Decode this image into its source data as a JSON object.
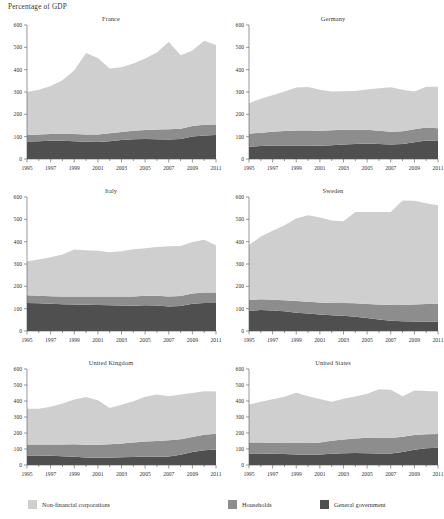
{
  "figure": {
    "header": "Percentage of GDP",
    "y_ticks": [
      0,
      100,
      200,
      300,
      400,
      500,
      600
    ],
    "x_ticks": [
      1995,
      1997,
      1999,
      2001,
      2003,
      2005,
      2007,
      2009,
      2011
    ],
    "years": [
      1995,
      1996,
      1997,
      1998,
      1999,
      2000,
      2001,
      2002,
      2003,
      2004,
      2005,
      2006,
      2007,
      2008,
      2009,
      2010,
      2011
    ]
  },
  "colors": {
    "non_financial_corporations": "#cfcfcf",
    "households": "#8d8d8d",
    "general_government": "#4f4f4f",
    "axis": "#555555",
    "text": "#333333",
    "background": "#ffffff"
  },
  "legend": {
    "items": [
      {
        "label": "Non-financial corporations",
        "color_key": "non_financial_corporations"
      },
      {
        "label": "Households",
        "color_key": "households"
      },
      {
        "label": "General government",
        "color_key": "general_government"
      }
    ]
  },
  "chart_data": {
    "type": "area",
    "stacked": true,
    "title": "",
    "xlabel": "",
    "ylabel": "Percentage of GDP",
    "ylim": [
      0,
      600
    ],
    "xlim": [
      1995,
      2011
    ],
    "grid": false,
    "legend_position": "bottom",
    "series_order": [
      "general_government",
      "households",
      "non_financial_corporations"
    ],
    "series_labels": {
      "general_government": "General government",
      "households": "Households",
      "non_financial_corporations": "Non-financial corporations"
    },
    "x": [
      1995,
      1996,
      1997,
      1998,
      1999,
      2000,
      2001,
      2002,
      2003,
      2004,
      2005,
      2006,
      2007,
      2008,
      2009,
      2010,
      2011
    ],
    "panels": [
      {
        "title": "France",
        "series": [
          {
            "name": "General government",
            "key": "general_government",
            "values": [
              78,
              80,
              82,
              82,
              80,
              77,
              76,
              80,
              85,
              88,
              89,
              88,
              87,
              90,
              101,
              105,
              107
            ]
          },
          {
            "name": "Households",
            "key": "households",
            "values": [
              30,
              30,
              30,
              31,
              32,
              33,
              34,
              35,
              36,
              38,
              41,
              44,
              46,
              46,
              47,
              48,
              48
            ]
          },
          {
            "name": "Non-financial corporations",
            "key": "non_financial_corporations",
            "values": [
              192,
              200,
              215,
              240,
              285,
              365,
              342,
              290,
              290,
              302,
              320,
              345,
              392,
              329,
              338,
              377,
              355
            ]
          }
        ],
        "totals": [
          300,
          310,
          327,
          353,
          397,
          475,
          452,
          405,
          411,
          428,
          450,
          477,
          525,
          465,
          486,
          530,
          510
        ]
      },
      {
        "title": "Germany",
        "series": [
          {
            "name": "General government",
            "key": "general_government",
            "values": [
              55,
              58,
              60,
              60,
              61,
              60,
              59,
              62,
              65,
              67,
              69,
              67,
              65,
              67,
              75,
              83,
              81
            ]
          },
          {
            "name": "Households",
            "key": "households",
            "values": [
              58,
              60,
              62,
              65,
              67,
              68,
              68,
              67,
              66,
              64,
              62,
              60,
              57,
              57,
              58,
              58,
              57
            ]
          },
          {
            "name": "Non-financial corporations",
            "key": "non_financial_corporations",
            "values": [
              137,
              152,
              163,
              177,
              192,
              194,
              183,
              173,
              172,
              174,
              180,
              190,
              199,
              186,
              169,
              183,
              186
            ]
          }
        ],
        "totals": [
          250,
          270,
          285,
          302,
          320,
          322,
          310,
          302,
          303,
          305,
          311,
          317,
          321,
          310,
          302,
          324,
          324
        ]
      },
      {
        "title": "Italy",
        "series": [
          {
            "name": "General government",
            "key": "general_government",
            "values": [
              125,
              124,
              122,
              120,
              119,
              117,
              116,
              115,
              114,
              113,
              115,
              114,
              110,
              112,
              122,
              125,
              125
            ]
          },
          {
            "name": "Households",
            "key": "households",
            "values": [
              35,
              34,
              34,
              35,
              36,
              37,
              38,
              39,
              40,
              42,
              43,
              44,
              45,
              45,
              46,
              47,
              47
            ]
          },
          {
            "name": "Non-financial corporations",
            "key": "non_financial_corporations",
            "values": [
              152,
              162,
              174,
              187,
              210,
              208,
              205,
              199,
              203,
              211,
              213,
              218,
              224,
              224,
              231,
              237,
              212
            ]
          }
        ],
        "totals": [
          312,
          320,
          330,
          342,
          365,
          362,
          359,
          353,
          357,
          366,
          371,
          376,
          379,
          381,
          399,
          409,
          384
        ]
      },
      {
        "title": "Sweden",
        "series": [
          {
            "name": "General government",
            "key": "general_government",
            "values": [
              90,
              94,
              92,
              88,
              82,
              78,
              74,
              70,
              68,
              64,
              58,
              52,
              46,
              44,
              43,
              42,
              41
            ]
          },
          {
            "name": "Households",
            "key": "households",
            "values": [
              49,
              48,
              48,
              50,
              52,
              53,
              54,
              55,
              57,
              60,
              63,
              67,
              70,
              72,
              76,
              79,
              81
            ]
          },
          {
            "name": "Non-financial corporations",
            "key": "non_financial_corporations",
            "values": [
              246,
              281,
              309,
              336,
              370,
              387,
              380,
              370,
              366,
              409,
              412,
              414,
              417,
              468,
              464,
              451,
              441
            ]
          }
        ],
        "totals": [
          385,
          423,
          449,
          474,
          504,
          518,
          508,
          495,
          491,
          533,
          533,
          533,
          533,
          584,
          583,
          572,
          563
        ]
      },
      {
        "title": "United Kingdom",
        "series": [
          {
            "name": "General government",
            "key": "general_government",
            "values": [
              60,
              60,
              58,
              55,
              52,
              47,
              45,
              46,
              48,
              50,
              53,
              52,
              53,
              64,
              81,
              92,
              97
            ]
          },
          {
            "name": "Households",
            "key": "households",
            "values": [
              68,
              68,
              70,
              73,
              77,
              80,
              82,
              84,
              87,
              91,
              94,
              98,
              101,
              97,
              94,
              97,
              99
            ]
          },
          {
            "name": "Non-financial corporations",
            "key": "non_financial_corporations",
            "values": [
              224,
              223,
              236,
              257,
              281,
              298,
              278,
              227,
              242,
              258,
              279,
              290,
              275,
              279,
              275,
              272,
              264
            ]
          }
        ],
        "totals": [
          352,
          351,
          364,
          385,
          410,
          425,
          405,
          357,
          377,
          399,
          426,
          440,
          429,
          440,
          450,
          461,
          460
        ]
      },
      {
        "title": "United States",
        "series": [
          {
            "name": "General government",
            "key": "general_government",
            "values": [
              72,
              72,
              70,
              68,
              66,
              64,
              65,
              70,
              74,
              75,
              74,
              72,
              72,
              82,
              96,
              105,
              108
            ]
          },
          {
            "name": "Households",
            "key": "households",
            "values": [
              68,
              68,
              69,
              70,
              72,
              73,
              76,
              81,
              86,
              91,
              96,
              97,
              96,
              95,
              92,
              87,
              85
            ]
          },
          {
            "name": "Non-financial corporations",
            "key": "non_financial_corporations",
            "values": [
              238,
              255,
              272,
              288,
              314,
              292,
              272,
              245,
              254,
              262,
              275,
              304,
              302,
              252,
              277,
              270,
              267
            ]
          }
        ],
        "totals": [
          378,
          395,
          411,
          426,
          452,
          429,
          413,
          396,
          414,
          428,
          445,
          473,
          470,
          429,
          465,
          462,
          460
        ]
      }
    ]
  }
}
